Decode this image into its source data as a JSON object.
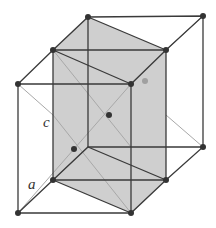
{
  "diagram": {
    "labels": {
      "c": "c",
      "a": "a"
    },
    "colors": {
      "edge": "#3a3a3a",
      "thin": "#9a9a9a",
      "face": "#cfcfcf",
      "atom": "#333333",
      "atom_light": "#9a9a9a"
    },
    "vertices": {
      "top": [
        [
          88,
          17
        ],
        [
          203,
          16
        ],
        [
          166,
          50
        ],
        [
          131,
          84
        ],
        [
          18,
          84
        ],
        [
          53,
          50
        ]
      ],
      "bottom": [
        [
          88,
          147
        ],
        [
          203,
          147
        ],
        [
          166,
          180
        ],
        [
          131,
          213
        ],
        [
          18,
          213
        ],
        [
          53,
          180
        ]
      ]
    },
    "interior_atoms": [
      [
        109,
        115
      ],
      [
        74,
        149
      ],
      [
        145,
        81
      ]
    ]
  }
}
